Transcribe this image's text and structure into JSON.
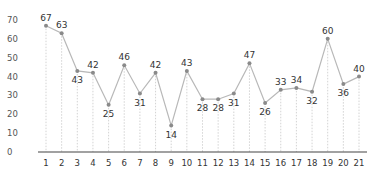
{
  "chart_data": {
    "type": "line",
    "title": "",
    "xlabel": "",
    "ylabel": "",
    "categories": [
      "1",
      "2",
      "3",
      "4",
      "5",
      "6",
      "7",
      "8",
      "9",
      "10",
      "11",
      "12",
      "13",
      "14",
      "15",
      "16",
      "17",
      "18",
      "19",
      "20",
      "21"
    ],
    "values": [
      67,
      63,
      43,
      42,
      25,
      46,
      31,
      42,
      14,
      43,
      28,
      28,
      31,
      47,
      26,
      33,
      34,
      32,
      60,
      36,
      40
    ],
    "label_position": [
      "above",
      "above",
      "below",
      "above",
      "below",
      "above",
      "below",
      "above",
      "below",
      "above",
      "below",
      "below",
      "below",
      "above",
      "below",
      "above",
      "above",
      "below",
      "above",
      "below",
      "above"
    ],
    "ylim": [
      0,
      70
    ],
    "yticks": [
      0,
      10,
      20,
      30,
      40,
      50,
      60,
      70
    ],
    "grid": false,
    "drop_lines": true,
    "legend": null,
    "colors": {
      "line": "#b8b8b8",
      "marker": "#8a8a8a",
      "axis": "#444444",
      "drop_line": "#c8c8c8"
    }
  }
}
